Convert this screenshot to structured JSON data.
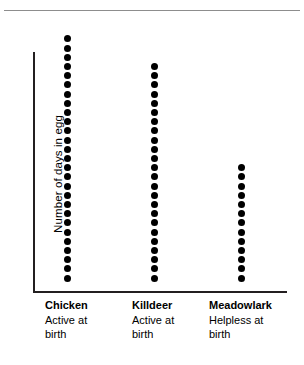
{
  "chart_data": {
    "type": "bar",
    "variant": "dot-plot-stacked-dots",
    "title": "",
    "subtitle": "",
    "xlabel": "",
    "ylabel": "Number of days in egg",
    "grid": false,
    "legend": null,
    "axis": {
      "y_ticks": [],
      "x_ticks": [],
      "ylim": [
        0,
        28
      ],
      "note": "y axis is unlabeled; each dot represents one day in the egg"
    },
    "categories": [
      "Chicken",
      "Killdeer",
      "Meadowlark"
    ],
    "values": [
      27,
      24,
      13
    ],
    "series": [
      {
        "name": "Number of days in egg",
        "values": [
          27,
          24,
          13
        ],
        "unit": "days",
        "marker": "filled-circle",
        "color": "#000000"
      }
    ],
    "annotations": [
      {
        "category": "Chicken",
        "text": "Active at birth"
      },
      {
        "category": "Killdeer",
        "text": "Active at birth"
      },
      {
        "category": "Meadowlark",
        "text": "Helpless at birth"
      }
    ]
  },
  "figure": {
    "y_axis_title": "Number of days in egg",
    "axis_color": "#231f20",
    "dot_color": "#000000",
    "rule_color": "#8d8d8d",
    "background": "#ffffff",
    "columns": [
      {
        "name": "Chicken",
        "dots": 27,
        "description_line1": "Active at",
        "description_line2": "birth"
      },
      {
        "name": "Killdeer",
        "dots": 24,
        "description_line1": "Active at",
        "description_line2": "birth"
      },
      {
        "name": "Meadowlark",
        "dots": 13,
        "description_line1": "Helpless at",
        "description_line2": "birth"
      }
    ]
  }
}
